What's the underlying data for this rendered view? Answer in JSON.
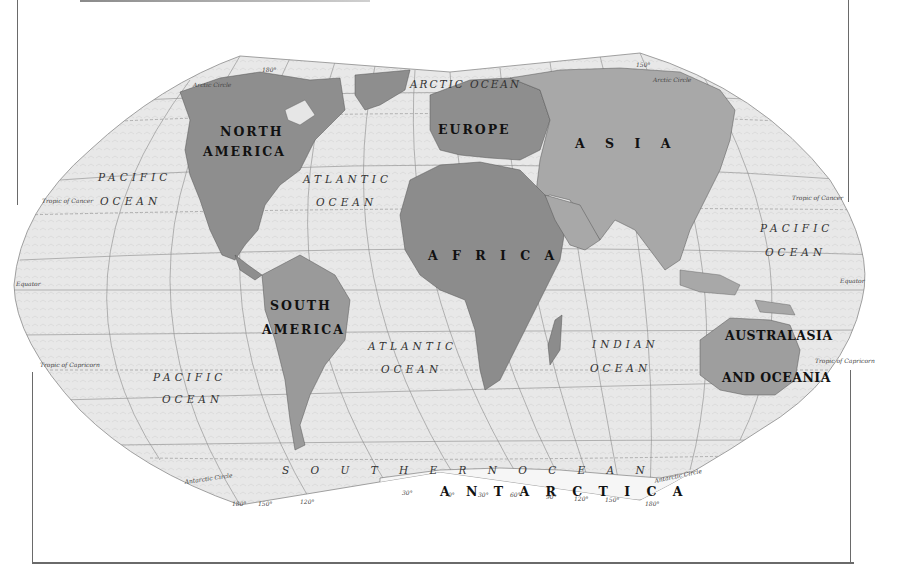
{
  "map": {
    "title": "World Physical Map",
    "projection": "Winkel Tripel",
    "colors": {
      "background": "#ffffff",
      "ocean": "#e6e6e6",
      "land_primary": "#8c8c8c",
      "land_secondary": "#a8a8a8",
      "ice": "#f4f4f4",
      "graticule": "#7a7a7a",
      "frame": "#6a6a6a"
    },
    "continents": [
      {
        "name": "NORTH",
        "line2": "AMERICA"
      },
      {
        "name": "SOUTH",
        "line2": "AMERICA"
      },
      {
        "name": "EUROPE"
      },
      {
        "name": "A S I A"
      },
      {
        "name": "A F R I C A"
      },
      {
        "name": "AUSTRALASIA",
        "line2": "AND OCEANIA"
      },
      {
        "name": "A N T A R C T I C A"
      }
    ],
    "oceans": [
      {
        "name": "ARCTIC OCEAN"
      },
      {
        "name": "PACIFIC",
        "line2": "OCEAN",
        "position": "north-west"
      },
      {
        "name": "ATLANTIC",
        "line2": "OCEAN",
        "position": "north"
      },
      {
        "name": "PACIFIC",
        "line2": "OCEAN",
        "position": "north-east"
      },
      {
        "name": "ATLANTIC",
        "line2": "OCEAN",
        "position": "south"
      },
      {
        "name": "INDIAN",
        "line2": "OCEAN"
      },
      {
        "name": "PACIFIC",
        "line2": "OCEAN",
        "position": "south-west"
      },
      {
        "name": "S O U T H E R N   O C E A N"
      }
    ],
    "reference_lines": {
      "arctic_circle": "Arctic Circle",
      "tropic_of_cancer": "Tropic of Cancer",
      "equator": "Equator",
      "tropic_of_capricorn": "Tropic of Capricorn",
      "antarctic_circle": "Antarctic Circle"
    },
    "degree_marks": {
      "bottom": [
        "180°",
        "150°",
        "120°",
        "30°",
        "0°",
        "30°",
        "60°",
        "90°",
        "120°",
        "150°",
        "180°"
      ],
      "top": [
        "180°",
        "150°"
      ]
    }
  }
}
